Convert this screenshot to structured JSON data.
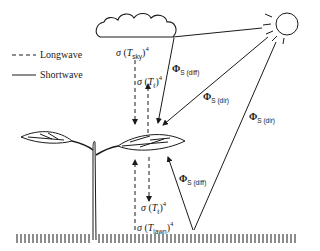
{
  "legend": {
    "items": [
      {
        "style": "dashed",
        "label": "Longwave"
      },
      {
        "style": "solid",
        "label": "Shortwave"
      }
    ]
  },
  "elements": {
    "cloud": "cloud-icon",
    "sun": "sun-icon",
    "plant": "seedling-icon",
    "ground": "ground-hatch"
  },
  "labels": {
    "sky_emission": {
      "sigma": "σ",
      "open": " (",
      "T": "T",
      "sub": "sky",
      "close": ")",
      "exp": "4"
    },
    "leaf_emission_up": {
      "sigma": "σ",
      "open": " (",
      "T": "T",
      "sub": "ℓ",
      "close": ")",
      "exp": "4"
    },
    "phi_diff_sky": {
      "phi": "Φ",
      "sub": "S (diff)"
    },
    "phi_dir_leaf": {
      "phi": "Φ",
      "sub": "S (dir)"
    },
    "phi_dir_ground": {
      "phi": "Φ",
      "sub": "S (dir)"
    },
    "phi_diff_ground": {
      "phi": "Φ",
      "sub": "S (diff)"
    },
    "leaf_emission_down": {
      "sigma": "σ",
      "open": " (",
      "T": "T",
      "sub": "ℓ",
      "close": ")",
      "exp": "4"
    },
    "lawn_emission": {
      "sigma": "σ",
      "open": " (",
      "T": "T",
      "sub": "lawn",
      "close": ")",
      "exp": "4"
    }
  }
}
